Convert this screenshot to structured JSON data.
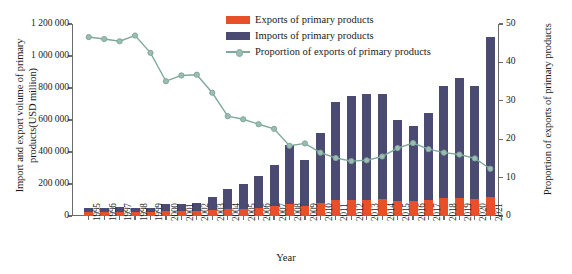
{
  "chart_data": {
    "type": "bar",
    "title": "",
    "xlabel": "Year",
    "ylabel_left": "Import and export volume of primary products(USD million)",
    "ylabel_right": "Proportion of exports of primary products",
    "categories": [
      "1995",
      "1996",
      "1997",
      "1998",
      "1999",
      "2000",
      "2001",
      "2002",
      "2003",
      "2004",
      "2005",
      "2006",
      "2007",
      "2008",
      "2009",
      "2010",
      "2011",
      "2012",
      "2013",
      "2014",
      "2015",
      "2016",
      "2017",
      "2018",
      "2019",
      "2020",
      "2021"
    ],
    "ylim_left": [
      0,
      1200000
    ],
    "ylim_right": [
      0,
      50
    ],
    "ytick_labels_left": [
      "0",
      "200 000",
      "400 000",
      "600 000",
      "800 000",
      "1 000 000",
      "1 200 000"
    ],
    "ytick_values_left": [
      0,
      200000,
      400000,
      600000,
      800000,
      1000000,
      1200000
    ],
    "ytick_labels_right": [
      "0",
      "10",
      "20",
      "30",
      "40",
      "50"
    ],
    "ytick_values_right": [
      0,
      10,
      20,
      30,
      40,
      50
    ],
    "grid": false,
    "legend_position": "top-center",
    "stacked": true,
    "series": [
      {
        "name": "Exports of primary products",
        "kind": "bar",
        "color": "#E8502A",
        "axis": "left",
        "values": [
          27000,
          28000,
          28000,
          25000,
          24000,
          30000,
          31000,
          33000,
          38000,
          42000,
          46000,
          51000,
          62000,
          78000,
          63000,
          82000,
          100000,
          101000,
          103000,
          105000,
          96000,
          92000,
          100000,
          115000,
          115000,
          105000,
          120000
        ]
      },
      {
        "name": "Imports of primary products",
        "kind": "bar",
        "color": "#4A4A72",
        "axis": "left",
        "values": [
          24000,
          25000,
          27000,
          22000,
          27000,
          45000,
          44000,
          50000,
          79000,
          127000,
          157000,
          196000,
          254000,
          363000,
          284000,
          434000,
          612000,
          649000,
          657000,
          655000,
          505000,
          470000,
          545000,
          695000,
          750000,
          705000,
          1000000
        ]
      },
      {
        "name": "Proportion of exports of primary products",
        "kind": "line",
        "color": "#7FA99B",
        "axis": "right",
        "values": [
          46.6,
          46.1,
          45.5,
          47.0,
          42.5,
          35.1,
          36.6,
          36.8,
          32.1,
          26.0,
          25.2,
          23.9,
          22.7,
          18.3,
          18.9,
          16.5,
          15.1,
          14.3,
          14.5,
          15.5,
          17.7,
          19.0,
          17.4,
          16.5,
          16.0,
          15.0,
          12.3
        ]
      }
    ]
  },
  "legend": {
    "items": [
      {
        "label": "Exports of primary products",
        "color": "#E8502A",
        "type": "swatch"
      },
      {
        "label": "Imports of primary products",
        "color": "#4A4A72",
        "type": "swatch"
      },
      {
        "label": "Proportion of exports of primary products",
        "color": "#7FA99B",
        "type": "line"
      }
    ]
  }
}
